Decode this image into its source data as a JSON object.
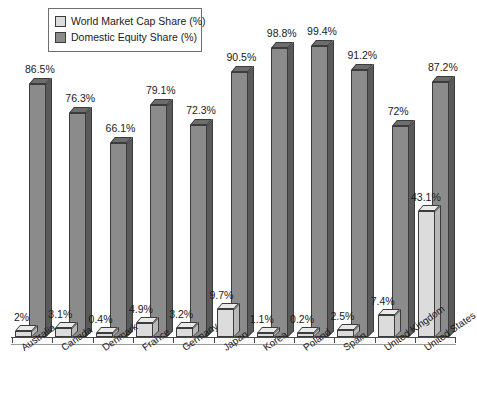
{
  "legend": {
    "items": [
      {
        "label": "World Market Cap Share (%)",
        "color": "#dcdcdc",
        "name": "legend-world-market-cap-share"
      },
      {
        "label": "Domestic Equity Share (%)",
        "color": "#8b8b8b",
        "name": "legend-domestic-equity-share"
      }
    ]
  },
  "chart_data": {
    "type": "bar",
    "title": "",
    "subtitle": "",
    "xlabel": "",
    "ylabel": "",
    "ylim": [
      0,
      100
    ],
    "grid": false,
    "legend_position": "top-left",
    "categories": [
      "Australia",
      "Canada",
      "Denmark",
      "France",
      "Germany",
      "Japan",
      "Korea",
      "Poland",
      "Spain",
      "United Kingdom",
      "United States"
    ],
    "series": [
      {
        "name": "World Market Cap Share (%)",
        "color": "#dcdcdc",
        "values": [
          2,
          3.1,
          0.4,
          4.9,
          3.2,
          9.7,
          1.1,
          0.2,
          2.5,
          7.4,
          43.1
        ],
        "labels": [
          "2%",
          "3.1%",
          "0.4%",
          "4.9%",
          "3.2%",
          "9.7%",
          "1.1%",
          "0.2%",
          "2.5%",
          "7.4%",
          "43.1%"
        ]
      },
      {
        "name": "Domestic Equity Share (%)",
        "color": "#8b8b8b",
        "values": [
          86.5,
          76.3,
          66.1,
          79.1,
          72.3,
          90.5,
          98.8,
          99.4,
          91.2,
          72,
          87.2
        ],
        "labels": [
          "86.5%",
          "76.3%",
          "66.1%",
          "79.1%",
          "72.3%",
          "90.5%",
          "98.8%",
          "99.4%",
          "91.2%",
          "72%",
          "87.2%"
        ]
      }
    ]
  }
}
